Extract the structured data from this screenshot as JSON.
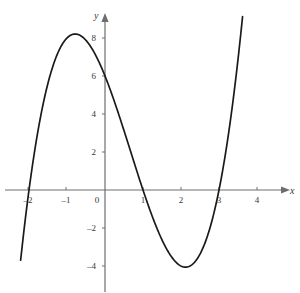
{
  "chart_data": {
    "type": "line",
    "title": "",
    "subtitle": "",
    "xlabel": "x",
    "ylabel": "y",
    "xlim": [
      -2.3,
      4.6
    ],
    "ylim": [
      -5.2,
      9.6
    ],
    "grid": false,
    "legend": "none",
    "xticks": [
      -2,
      -1,
      0,
      1,
      2,
      3,
      4
    ],
    "xtick_labels": [
      "–2",
      "–1",
      "0",
      "1",
      "2",
      "3",
      "4"
    ],
    "yticks": [
      -4,
      -2,
      0,
      2,
      4,
      6,
      8
    ],
    "ytick_labels": [
      "–4",
      "–2",
      "0",
      "2",
      "4",
      "6",
      "8"
    ],
    "zero_label": "0",
    "curve_color": "#1a1a1a",
    "axis_color": "#6e6e6e",
    "series": [
      {
        "name": "cubic",
        "equation": "y = (x + 2)(x - 1)(x - 3) = x^3 - 2x^2 - 5x + 6",
        "coefficients": [
          1,
          -2,
          -5,
          6
        ],
        "x_domain": [
          -2.22,
          3.62
        ],
        "roots": [
          -2,
          1,
          3
        ],
        "y_intercept": 6,
        "local_max": {
          "x": -0.786,
          "y": 8.209
        },
        "local_min": {
          "x": 2.12,
          "y": -4.061
        },
        "points": [
          {
            "x": -2.22,
            "y": -4.09
          },
          {
            "x": -2.0,
            "y": 0.0
          },
          {
            "x": -1.75,
            "y": 3.98
          },
          {
            "x": -1.5,
            "y": 6.88
          },
          {
            "x": -1.25,
            "y": 8.39
          },
          {
            "x": -1.0,
            "y": 8.0
          },
          {
            "x": -0.786,
            "y": 8.21
          },
          {
            "x": -0.5,
            "y": 7.88
          },
          {
            "x": -0.25,
            "y": 7.11
          },
          {
            "x": 0.0,
            "y": 6.0
          },
          {
            "x": 0.25,
            "y": 4.64
          },
          {
            "x": 0.5,
            "y": 3.13
          },
          {
            "x": 0.75,
            "y": 1.55
          },
          {
            "x": 1.0,
            "y": 0.0
          },
          {
            "x": 1.25,
            "y": -1.42
          },
          {
            "x": 1.5,
            "y": -2.63
          },
          {
            "x": 1.75,
            "y": -3.52
          },
          {
            "x": 2.0,
            "y": -4.0
          },
          {
            "x": 2.12,
            "y": -4.06
          },
          {
            "x": 2.25,
            "y": -3.98
          },
          {
            "x": 2.5,
            "y": -3.38
          },
          {
            "x": 2.75,
            "y": -2.11
          },
          {
            "x": 3.0,
            "y": 0.0
          },
          {
            "x": 3.25,
            "y": 3.05
          },
          {
            "x": 3.5,
            "y": 7.13
          },
          {
            "x": 3.62,
            "y": 9.38
          }
        ]
      }
    ]
  },
  "axes": {
    "x_axis_name": "x",
    "y_axis_name": "y"
  }
}
